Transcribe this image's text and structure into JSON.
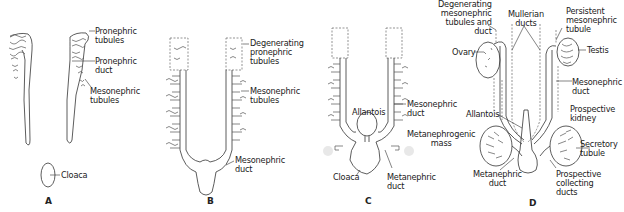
{
  "figure": {
    "panels": [
      {
        "id": "A",
        "label": "A",
        "annotations": [
          {
            "text": "Pronephric\ntubules"
          },
          {
            "text": "Pronephric\nduct"
          },
          {
            "text": "Mesonephric\ntubules"
          },
          {
            "text": "Cloaca"
          }
        ]
      },
      {
        "id": "B",
        "label": "B",
        "annotations": [
          {
            "text": "Degenerating\npronephric\ntubules"
          },
          {
            "text": "Mesonephric\ntubules"
          },
          {
            "text": "Mesonephric\nduct"
          }
        ]
      },
      {
        "id": "C",
        "label": "C",
        "annotations": [
          {
            "text": "Mesonephric\nduct"
          },
          {
            "text": "Allantois"
          },
          {
            "text": "Metanephrogenic\nmass"
          },
          {
            "text": "Cloaca"
          },
          {
            "text": "Metanephric\nduct"
          }
        ]
      },
      {
        "id": "D",
        "label": "D",
        "annotations": [
          {
            "text": "Degenerating\nmesonephric\ntubules and\nduct"
          },
          {
            "text": "Mullerian\nducts"
          },
          {
            "text": "Persistent\nmesonephric\ntubule"
          },
          {
            "text": "Ovary"
          },
          {
            "text": "Testis"
          },
          {
            "text": "Mesonephric\nduct"
          },
          {
            "text": "Allantois"
          },
          {
            "text": "Prospective\nkidney"
          },
          {
            "text": "Secretory\ntubule"
          },
          {
            "text": "Metanephric\nduct"
          },
          {
            "text": "Prospective\ncollecting\nducts"
          }
        ]
      }
    ]
  }
}
